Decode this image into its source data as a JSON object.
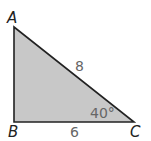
{
  "diagram": {
    "type": "right-triangle",
    "fill_color": "#c8c8c8",
    "stroke_color": "#222222",
    "vertices": {
      "A": {
        "label": "A",
        "x": 14,
        "y": 27
      },
      "B": {
        "label": "B",
        "x": 14,
        "y": 122
      },
      "C": {
        "label": "C",
        "x": 134,
        "y": 122
      }
    },
    "measurements": {
      "hypotenuse_AC": "8",
      "side_BC": "6",
      "angle_C": "40°"
    }
  }
}
